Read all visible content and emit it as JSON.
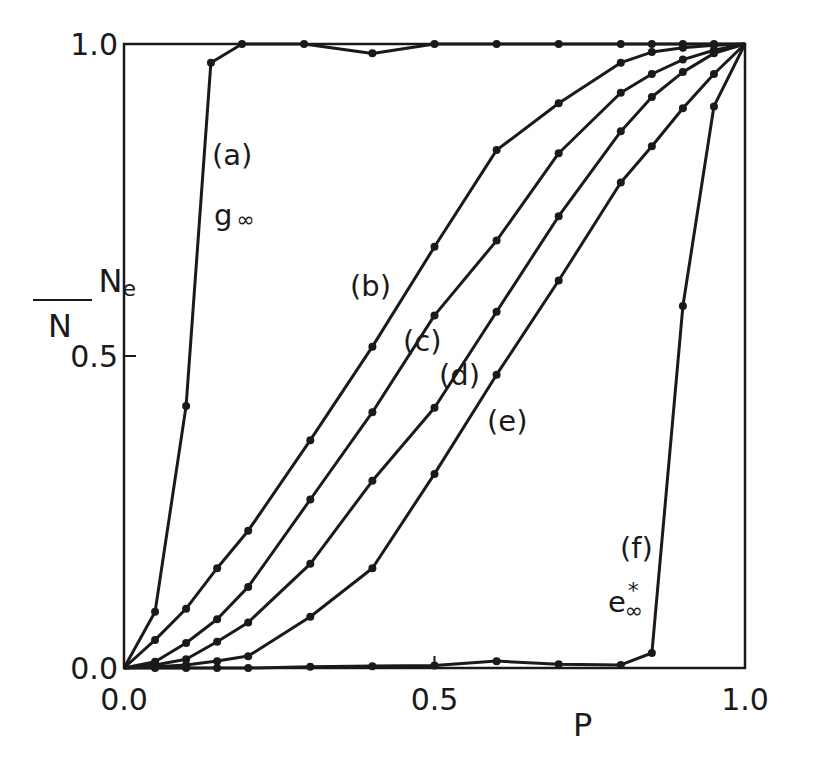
{
  "chart_data": {
    "type": "line",
    "title": "",
    "xlabel": "P",
    "ylabel": "Ne/N",
    "ylabel_parts": {
      "numerator": "N",
      "numerator_sub": "e",
      "denominator": "N"
    },
    "xlim": [
      0.0,
      1.0
    ],
    "ylim": [
      0.0,
      1.0
    ],
    "x_ticks": [
      {
        "value": 0.0,
        "label": "0.0"
      },
      {
        "value": 0.5,
        "label": "0.5"
      },
      {
        "value": 1.0,
        "label": "1.0"
      }
    ],
    "y_ticks": [
      {
        "value": 0.0,
        "label": "0.0"
      },
      {
        "value": 0.5,
        "label": "0.5"
      },
      {
        "value": 1.0,
        "label": "1.0"
      }
    ],
    "grid": false,
    "markers": "filled-circle",
    "series": [
      {
        "name": "(a)",
        "sublabel": "g∞",
        "x": [
          0.0,
          0.05,
          0.1,
          0.14,
          0.19,
          0.29,
          0.4,
          0.5,
          0.6,
          0.7,
          0.8,
          0.85,
          0.9,
          0.95,
          1.0
        ],
        "y": [
          0.0,
          0.09,
          0.42,
          0.97,
          1.0,
          1.0,
          0.985,
          1.0,
          1.0,
          1.0,
          1.0,
          1.0,
          1.0,
          1.0,
          1.0
        ]
      },
      {
        "name": "(b)",
        "x": [
          0.0,
          0.05,
          0.1,
          0.15,
          0.2,
          0.3,
          0.4,
          0.5,
          0.6,
          0.7,
          0.8,
          0.85,
          0.9,
          0.95,
          1.0
        ],
        "y": [
          0.0,
          0.045,
          0.095,
          0.16,
          0.22,
          0.365,
          0.515,
          0.675,
          0.83,
          0.905,
          0.97,
          0.987,
          0.994,
          0.998,
          1.0
        ]
      },
      {
        "name": "(c)",
        "x": [
          0.0,
          0.05,
          0.1,
          0.15,
          0.2,
          0.3,
          0.4,
          0.5,
          0.6,
          0.7,
          0.8,
          0.85,
          0.9,
          0.95,
          1.0
        ],
        "y": [
          0.0,
          0.01,
          0.04,
          0.078,
          0.13,
          0.27,
          0.41,
          0.565,
          0.685,
          0.825,
          0.922,
          0.952,
          0.975,
          0.99,
          1.0
        ]
      },
      {
        "name": "(d)",
        "x": [
          0.0,
          0.05,
          0.1,
          0.15,
          0.2,
          0.3,
          0.4,
          0.5,
          0.6,
          0.7,
          0.8,
          0.85,
          0.9,
          0.95,
          1.0
        ],
        "y": [
          0.0,
          0.005,
          0.014,
          0.042,
          0.073,
          0.167,
          0.3,
          0.417,
          0.571,
          0.724,
          0.86,
          0.915,
          0.955,
          0.985,
          1.0
        ]
      },
      {
        "name": "(e)",
        "x": [
          0.0,
          0.05,
          0.1,
          0.15,
          0.2,
          0.3,
          0.4,
          0.5,
          0.6,
          0.7,
          0.8,
          0.85,
          0.9,
          0.95,
          1.0
        ],
        "y": [
          0.0,
          0.002,
          0.005,
          0.011,
          0.019,
          0.082,
          0.16,
          0.311,
          0.47,
          0.621,
          0.778,
          0.836,
          0.897,
          0.952,
          1.0
        ]
      },
      {
        "name": "(f)",
        "sublabel": "e*∞",
        "x": [
          0.0,
          0.05,
          0.1,
          0.15,
          0.2,
          0.3,
          0.4,
          0.5,
          0.6,
          0.7,
          0.8,
          0.85,
          0.9,
          0.95,
          1.0
        ],
        "y": [
          0.0,
          0.0,
          0.0,
          0.0,
          0.0,
          0.002,
          0.003,
          0.004,
          0.011,
          0.006,
          0.005,
          0.024,
          0.58,
          0.9,
          1.0
        ]
      }
    ],
    "annotations": [
      {
        "text": "(a)",
        "x": 212,
        "y": 165
      },
      {
        "text": "g",
        "x": 214,
        "y": 225,
        "sub": "∞"
      },
      {
        "text": "(b)",
        "x": 350,
        "y": 296
      },
      {
        "text": "(c)",
        "x": 403,
        "y": 351
      },
      {
        "text": "(d)",
        "x": 439,
        "y": 385
      },
      {
        "text": "(e)",
        "x": 487,
        "y": 431
      },
      {
        "text": "(f)",
        "x": 620,
        "y": 558
      },
      {
        "text": "e",
        "x": 608,
        "y": 612,
        "sub": "∞",
        "sup": "*"
      }
    ]
  },
  "layout": {
    "plot_left": 124,
    "plot_right": 745,
    "plot_top": 44,
    "plot_bottom": 668,
    "line_color": "#1a1a1a",
    "background": "#ffffff"
  }
}
